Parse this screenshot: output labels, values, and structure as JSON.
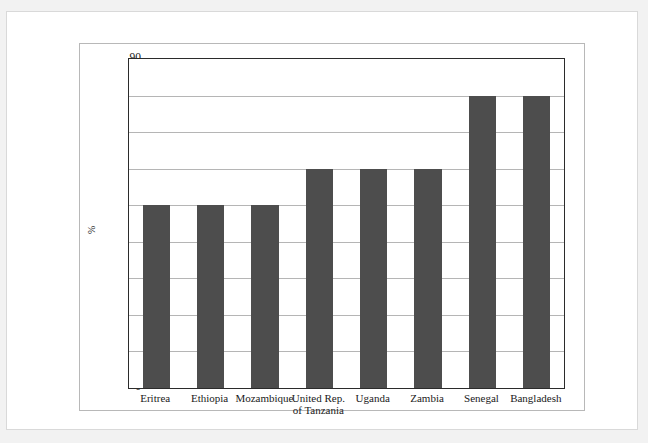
{
  "page": {
    "ghost_header_text": ""
  },
  "chart_data": {
    "type": "bar",
    "title": "",
    "subtitle": "",
    "xlabel": "",
    "ylabel": "%",
    "categories": [
      "Eritrea",
      "Ethiopia",
      "Mozambique",
      "United Rep.\nof Tanzania",
      "Uganda",
      "Zambia",
      "Senegal",
      "Bangladesh"
    ],
    "values": [
      50,
      50,
      50,
      60,
      60,
      60,
      80,
      80
    ],
    "ylim": [
      0,
      90
    ],
    "ytick_step": 10,
    "yticks": [
      0,
      10,
      20,
      30,
      40,
      50,
      60,
      70,
      80,
      90
    ],
    "ytick_labels": [
      "0",
      "10",
      "20",
      "30",
      "40",
      "50",
      "60",
      "70",
      "80",
      "90"
    ],
    "grid": true,
    "grid_axis": "y",
    "legend": false,
    "legend_position": "none",
    "bar_color": "#4d4d4d",
    "grid_color": "#b5b5b5",
    "axis_color": "#2b2b2b",
    "background_color": "#ffffff"
  }
}
